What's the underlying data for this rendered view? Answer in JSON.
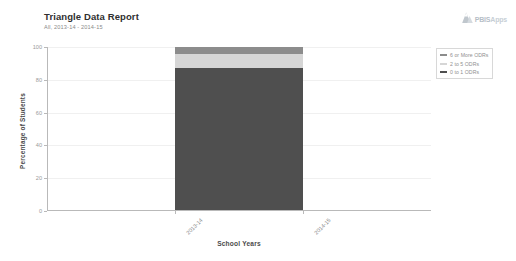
{
  "header": {
    "title": "Triangle Data Report",
    "subtitle": "All, 2013-14 - 2014-15"
  },
  "logo": {
    "icon": "mountain-triangle-icon",
    "text_primary": "PBIS",
    "text_secondary": "Apps"
  },
  "legend": {
    "items": [
      {
        "label": "6 or More ODRs",
        "color": "#8c8c8c"
      },
      {
        "label": "2 to 5 ODRs",
        "color": "#d6d6d6"
      },
      {
        "label": "0 to 1 ODRs",
        "color": "#4f4f4f"
      }
    ]
  },
  "chart_data": {
    "type": "area",
    "title": "Triangle Data Report",
    "subtitle": "All, 2013-14 - 2014-15",
    "xlabel": "School Years",
    "ylabel": "Percentage of Students",
    "categories": [
      "2013-14",
      "2014-15"
    ],
    "x_tick_labels": [
      "2013-14",
      "2014-15"
    ],
    "y_tick_labels": [
      "0",
      "20",
      "40",
      "60",
      "80",
      "100"
    ],
    "y_ticks": [
      0,
      20,
      40,
      60,
      80,
      100
    ],
    "ylim": [
      0,
      100
    ],
    "grid": true,
    "legend_position": "right",
    "stacked": true,
    "series": [
      {
        "name": "0 to 1 ODRs",
        "color": "#4f4f4f",
        "values": [
          87,
          87
        ]
      },
      {
        "name": "2 to 5 ODRs",
        "color": "#d6d6d6",
        "values": [
          9,
          9
        ]
      },
      {
        "name": "6 or More ODRs",
        "color": "#8c8c8c",
        "values": [
          4,
          4
        ]
      }
    ]
  }
}
